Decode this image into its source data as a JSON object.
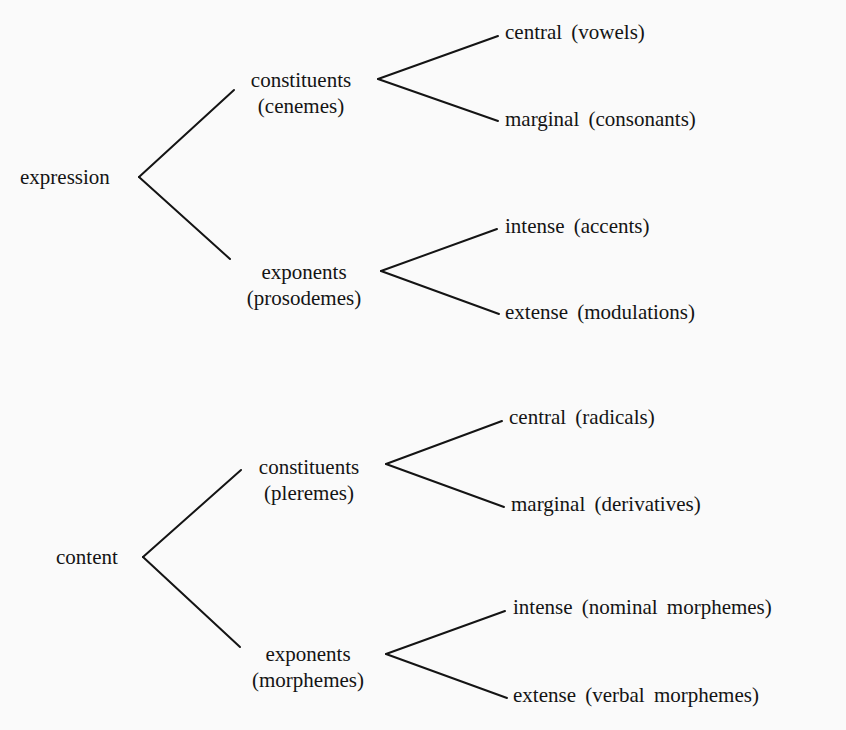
{
  "diagram": {
    "type": "tree",
    "orientation": "left-to-right",
    "roots": [
      {
        "label": "expression",
        "children": [
          {
            "label": "constituents",
            "sublabel": "(cenemes)",
            "children": [
              {
                "label": "central (vowels)"
              },
              {
                "label": "marginal (consonants)"
              }
            ]
          },
          {
            "label": "exponents",
            "sublabel": "(prosodemes)",
            "children": [
              {
                "label": "intense (accents)"
              },
              {
                "label": "extense (modulations)"
              }
            ]
          }
        ]
      },
      {
        "label": "content",
        "children": [
          {
            "label": "constituents",
            "sublabel": "(pleremes)",
            "children": [
              {
                "label": "central (radicals)"
              },
              {
                "label": "marginal (derivatives)"
              }
            ]
          },
          {
            "label": "exponents",
            "sublabel": "(morphemes)",
            "children": [
              {
                "label": "intense (nominal morphemes)"
              },
              {
                "label": "extense (verbal morphemes)"
              }
            ]
          }
        ]
      }
    ]
  },
  "colors": {
    "background": "#fafafa",
    "ink": "#141414"
  }
}
